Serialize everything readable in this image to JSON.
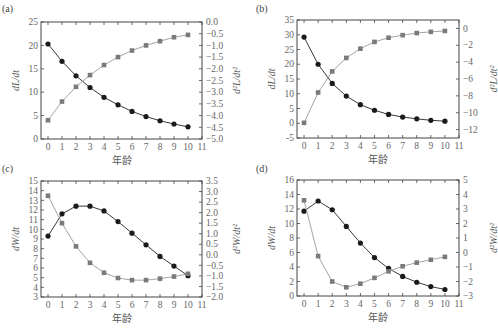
{
  "chart_data": [
    {
      "panel": "(a)",
      "type": "line",
      "x": [
        0,
        1,
        2,
        3,
        4,
        5,
        6,
        7,
        8,
        9,
        10
      ],
      "xlabel": "年龄",
      "xticks": [
        0,
        1,
        2,
        3,
        4,
        5,
        6,
        7,
        8,
        9,
        10,
        11
      ],
      "xlim": [
        -0.5,
        11
      ],
      "ylabel": "dL/dt",
      "ylim": [
        0,
        25
      ],
      "yticks": [
        0,
        5,
        10,
        15,
        20,
        25
      ],
      "y2label": "d²L/dt²",
      "y2lim": [
        -5.0,
        0.0
      ],
      "y2ticks": [
        "0.0",
        "-0.5",
        "-1.0",
        "-1.5",
        "-2.0",
        "-2.5",
        "-3.0",
        "-3.5",
        "-4.0",
        "-4.5",
        "-5.0"
      ],
      "series": [
        {
          "name": "dL/dt",
          "marker": "circle",
          "axis": "left",
          "values": [
            20.3,
            16.6,
            13.5,
            11.0,
            8.9,
            7.3,
            5.9,
            4.8,
            3.9,
            3.2,
            2.6
          ]
        },
        {
          "name": "d²L/dt²",
          "marker": "square",
          "axis": "right",
          "values": [
            -4.2,
            -3.4,
            -2.77,
            -2.27,
            -1.84,
            -1.5,
            -1.22,
            -1.0,
            -0.82,
            -0.65,
            -0.55
          ]
        }
      ]
    },
    {
      "panel": "(b)",
      "type": "line",
      "x": [
        0,
        1,
        2,
        3,
        4,
        5,
        6,
        7,
        8,
        9,
        10
      ],
      "xlabel": "年龄",
      "xticks": [
        0,
        1,
        2,
        3,
        4,
        5,
        6,
        7,
        8,
        9,
        10,
        11
      ],
      "xlim": [
        -0.5,
        11
      ],
      "ylabel": "dL/dt",
      "ylim": [
        -5,
        35
      ],
      "yticks": [
        -5,
        0,
        5,
        10,
        15,
        20,
        25,
        30,
        35
      ],
      "y2label": "d²L/dt²",
      "y2lim": [
        -13,
        1
      ],
      "y2ticks": [
        "0",
        "-2",
        "-4",
        "-6",
        "-8",
        "-10",
        "-12"
      ],
      "series": [
        {
          "name": "dL/dt",
          "marker": "circle",
          "axis": "left",
          "values": [
            29.2,
            20.0,
            13.5,
            9.2,
            6.3,
            4.4,
            3.0,
            2.1,
            1.5,
            1.0,
            0.7
          ]
        },
        {
          "name": "d²L/dt²",
          "marker": "square",
          "axis": "right",
          "values": [
            -11.2,
            -7.6,
            -5.1,
            -3.5,
            -2.4,
            -1.6,
            -1.1,
            -0.8,
            -0.55,
            -0.4,
            -0.3
          ]
        }
      ]
    },
    {
      "panel": "(c)",
      "type": "line",
      "x": [
        0,
        1,
        2,
        3,
        4,
        5,
        6,
        7,
        8,
        9,
        10
      ],
      "xlabel": "年龄",
      "xticks": [
        0,
        1,
        2,
        3,
        4,
        5,
        6,
        7,
        8,
        9,
        10,
        11
      ],
      "xlim": [
        -0.5,
        11
      ],
      "ylabel": "dW/dt",
      "ylim": [
        3,
        15
      ],
      "yticks": [
        3,
        4,
        5,
        6,
        7,
        8,
        9,
        10,
        11,
        12,
        13,
        14,
        15
      ],
      "y2label": "d²W/dt²",
      "y2lim": [
        -2.0,
        3.5
      ],
      "y2ticks": [
        "3.5",
        "3.0",
        "2.5",
        "2.0",
        "1.5",
        "1.0",
        "0.5",
        "0.0",
        "-0.5",
        "-1.0",
        "-1.5",
        "-2.0"
      ],
      "series": [
        {
          "name": "dW/dt",
          "marker": "circle",
          "axis": "left",
          "values": [
            9.3,
            11.6,
            12.4,
            12.4,
            11.9,
            10.8,
            9.6,
            8.4,
            7.2,
            6.2,
            5.2
          ]
        },
        {
          "name": "d²W/dt²",
          "marker": "square",
          "axis": "right",
          "values": [
            2.8,
            1.5,
            0.4,
            -0.38,
            -0.85,
            -1.1,
            -1.2,
            -1.2,
            -1.13,
            -1.03,
            -0.9
          ]
        }
      ]
    },
    {
      "panel": "(d)",
      "type": "line",
      "x": [
        0,
        1,
        2,
        3,
        4,
        5,
        6,
        7,
        8,
        9,
        10
      ],
      "xlabel": "年龄",
      "xticks": [
        0,
        1,
        2,
        3,
        4,
        5,
        6,
        7,
        8,
        9,
        10,
        11
      ],
      "xlim": [
        -0.5,
        11
      ],
      "ylabel": "dW/dt",
      "ylim": [
        0,
        16
      ],
      "yticks": [
        0,
        2,
        4,
        6,
        8,
        10,
        12,
        14,
        16
      ],
      "y2label": "d²W/dt²",
      "y2lim": [
        -3,
        5
      ],
      "y2ticks": [
        "5",
        "4",
        "3",
        "2",
        "1",
        "0",
        "-1",
        "-2",
        "-3"
      ],
      "series": [
        {
          "name": "dW/dt",
          "marker": "circle",
          "axis": "left",
          "values": [
            11.7,
            13.1,
            11.9,
            9.6,
            7.3,
            5.3,
            3.8,
            2.7,
            1.9,
            1.3,
            0.9
          ]
        },
        {
          "name": "d²W/dt²",
          "marker": "square",
          "axis": "right",
          "values": [
            3.6,
            -0.25,
            -2.0,
            -2.4,
            -2.15,
            -1.75,
            -1.3,
            -0.95,
            -0.7,
            -0.5,
            -0.3
          ]
        }
      ]
    }
  ],
  "layout": {
    "panels": [
      {
        "label": "(a)",
        "frame": [
          41,
          22,
          202,
          139
        ],
        "label_pos": [
          2,
          12
        ]
      },
      {
        "label": "(b)",
        "frame": [
          297,
          20,
          459,
          138
        ],
        "label_pos": [
          256,
          12
        ]
      },
      {
        "label": "(c)",
        "frame": [
          41,
          181,
          202,
          297
        ],
        "label_pos": [
          2,
          172
        ]
      },
      {
        "label": "(d)",
        "frame": [
          297,
          180,
          459,
          296
        ],
        "label_pos": [
          256,
          172
        ]
      }
    ],
    "colors": {
      "circle": "#1a1a1a",
      "square": "#7a7a7a",
      "circle_line": "#3a3a3a",
      "square_line": "#9a9a9a",
      "axis": "#444444"
    }
  }
}
